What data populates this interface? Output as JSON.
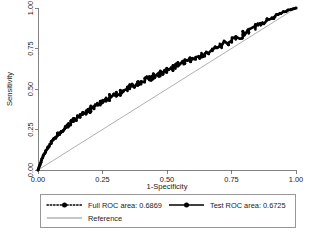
{
  "chart_data": {
    "type": "line",
    "title": "",
    "xlabel": "1-Specificity",
    "ylabel": "Sensitivity",
    "xlim": [
      0,
      1
    ],
    "ylim": [
      0,
      1
    ],
    "grid": false,
    "legend_position": "below-plot",
    "x_ticks": [
      "0.00",
      "0.25",
      "0.50",
      "0.75",
      "1.00"
    ],
    "y_ticks": [
      "0.00",
      "0.25",
      "0.50",
      "0.75",
      "1.00"
    ],
    "x_tick_values": [
      0,
      0.25,
      0.5,
      0.75,
      1
    ],
    "y_tick_values": [
      0,
      0.25,
      0.5,
      0.75,
      1
    ],
    "series": [
      {
        "name": "Full ROC area: 0.6869",
        "area": 0.6869,
        "style": "dotted-with-markers",
        "color": "#000000",
        "points": [
          [
            0.0,
            0.0
          ],
          [
            0.004,
            0.018
          ],
          [
            0.008,
            0.035
          ],
          [
            0.011,
            0.048
          ],
          [
            0.014,
            0.062
          ],
          [
            0.018,
            0.079
          ],
          [
            0.022,
            0.092
          ],
          [
            0.026,
            0.104
          ],
          [
            0.03,
            0.118
          ],
          [
            0.034,
            0.128
          ],
          [
            0.038,
            0.14
          ],
          [
            0.043,
            0.152
          ],
          [
            0.047,
            0.161
          ],
          [
            0.052,
            0.172
          ],
          [
            0.056,
            0.181
          ],
          [
            0.061,
            0.19
          ],
          [
            0.066,
            0.199
          ],
          [
            0.071,
            0.21
          ],
          [
            0.076,
            0.218
          ],
          [
            0.081,
            0.226
          ],
          [
            0.086,
            0.234
          ],
          [
            0.091,
            0.241
          ],
          [
            0.097,
            0.25
          ],
          [
            0.102,
            0.258
          ],
          [
            0.108,
            0.267
          ],
          [
            0.113,
            0.274
          ],
          [
            0.119,
            0.282
          ],
          [
            0.125,
            0.29
          ],
          [
            0.131,
            0.297
          ],
          [
            0.137,
            0.305
          ],
          [
            0.143,
            0.312
          ],
          [
            0.149,
            0.319
          ],
          [
            0.155,
            0.327
          ],
          [
            0.161,
            0.333
          ],
          [
            0.168,
            0.341
          ],
          [
            0.174,
            0.348
          ],
          [
            0.181,
            0.355
          ],
          [
            0.187,
            0.362
          ],
          [
            0.194,
            0.369
          ],
          [
            0.201,
            0.376
          ],
          [
            0.208,
            0.383
          ],
          [
            0.215,
            0.39
          ],
          [
            0.222,
            0.397
          ],
          [
            0.229,
            0.404
          ],
          [
            0.236,
            0.411
          ],
          [
            0.243,
            0.417
          ],
          [
            0.251,
            0.424
          ],
          [
            0.258,
            0.431
          ],
          [
            0.266,
            0.438
          ],
          [
            0.273,
            0.444
          ],
          [
            0.281,
            0.451
          ],
          [
            0.289,
            0.458
          ],
          [
            0.297,
            0.464
          ],
          [
            0.305,
            0.471
          ],
          [
            0.313,
            0.478
          ],
          [
            0.321,
            0.484
          ],
          [
            0.329,
            0.491
          ],
          [
            0.338,
            0.497
          ],
          [
            0.346,
            0.504
          ],
          [
            0.355,
            0.511
          ],
          [
            0.363,
            0.517
          ],
          [
            0.372,
            0.524
          ],
          [
            0.381,
            0.531
          ],
          [
            0.39,
            0.537
          ],
          [
            0.399,
            0.544
          ],
          [
            0.408,
            0.551
          ],
          [
            0.417,
            0.557
          ],
          [
            0.427,
            0.564
          ],
          [
            0.436,
            0.571
          ],
          [
            0.446,
            0.578
          ],
          [
            0.455,
            0.585
          ],
          [
            0.465,
            0.592
          ],
          [
            0.475,
            0.599
          ],
          [
            0.485,
            0.606
          ],
          [
            0.495,
            0.613
          ],
          [
            0.505,
            0.62
          ],
          [
            0.515,
            0.628
          ],
          [
            0.526,
            0.635
          ],
          [
            0.536,
            0.642
          ],
          [
            0.547,
            0.65
          ],
          [
            0.557,
            0.658
          ],
          [
            0.568,
            0.665
          ],
          [
            0.579,
            0.673
          ],
          [
            0.59,
            0.681
          ],
          [
            0.601,
            0.689
          ],
          [
            0.612,
            0.697
          ],
          [
            0.624,
            0.705
          ],
          [
            0.635,
            0.714
          ],
          [
            0.647,
            0.722
          ],
          [
            0.658,
            0.731
          ],
          [
            0.67,
            0.74
          ],
          [
            0.682,
            0.749
          ],
          [
            0.694,
            0.758
          ],
          [
            0.706,
            0.767
          ],
          [
            0.718,
            0.777
          ],
          [
            0.731,
            0.787
          ],
          [
            0.743,
            0.797
          ],
          [
            0.756,
            0.807
          ],
          [
            0.769,
            0.818
          ],
          [
            0.782,
            0.829
          ],
          [
            0.795,
            0.84
          ],
          [
            0.808,
            0.851
          ],
          [
            0.822,
            0.863
          ],
          [
            0.835,
            0.875
          ],
          [
            0.849,
            0.887
          ],
          [
            0.863,
            0.9
          ],
          [
            0.877,
            0.913
          ],
          [
            0.891,
            0.926
          ],
          [
            0.906,
            0.939
          ],
          [
            0.92,
            0.952
          ],
          [
            0.935,
            0.964
          ],
          [
            0.95,
            0.975
          ],
          [
            0.965,
            0.984
          ],
          [
            0.98,
            0.991
          ],
          [
            0.99,
            0.996
          ],
          [
            1.0,
            1.0
          ]
        ]
      },
      {
        "name": "Test ROC area: 0.6725",
        "area": 0.6725,
        "style": "solid-with-markers",
        "color": "#000000"
      },
      {
        "name": "Reference",
        "style": "solid-thin",
        "color": "#8c8c8c",
        "points": [
          [
            0,
            0
          ],
          [
            1,
            1
          ]
        ]
      }
    ]
  },
  "legend": {
    "entries": [
      {
        "label": "Full ROC area: 0.6869",
        "marker": "dotted-circle-marker"
      },
      {
        "label": "Test ROC area: 0.6725",
        "marker": "solid-circle-marker"
      },
      {
        "label": "Reference",
        "marker": "plain-line"
      }
    ]
  }
}
